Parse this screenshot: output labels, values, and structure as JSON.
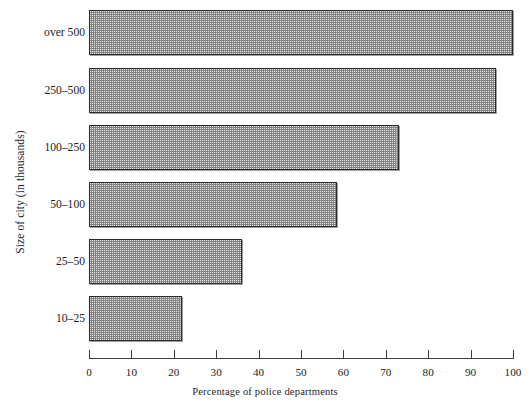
{
  "chart_data": {
    "type": "bar",
    "orientation": "horizontal",
    "title": "",
    "xlabel": "Percentage of police departments",
    "ylabel": "Size of city (in thousands)",
    "categories": [
      "over 500",
      "250–500",
      "100–250",
      "50–100",
      "25–50",
      "10–25"
    ],
    "values": [
      100,
      96,
      73,
      58.5,
      36,
      22
    ],
    "xlim": [
      0,
      100
    ],
    "xticks": [
      0,
      10,
      20,
      30,
      40,
      50,
      60,
      70,
      80,
      90,
      100
    ],
    "xtick_labels": [
      "0",
      "10",
      "20",
      "30",
      "40",
      "50",
      "60",
      "70",
      "80",
      "90",
      "100"
    ],
    "grid": false,
    "legend": false,
    "bar_fill_color": "#e4e4e4",
    "bar_edge_color": "#2a2a2a"
  }
}
